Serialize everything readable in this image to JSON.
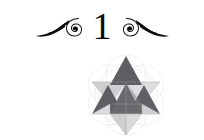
{
  "page": {
    "background_color": "#ffffff",
    "kind": "chapter-opening-page"
  },
  "heading": {
    "chapter_number": "1",
    "left_flourish_icon": "swash-flourish-left-icon",
    "right_flourish_icon": "swash-flourish-right-icon",
    "ink_color": "#0d0d0d"
  },
  "illustration": {
    "title": "star-tetrahedron-merkaba",
    "background_pattern": "flower-of-life-circles",
    "background_pattern_color": "#e8e6ea",
    "palette": {
      "dark": "#5f5f63",
      "dark_alt": "#6a6a6e",
      "mid": "#8e8e92",
      "light": "#c9c9cb",
      "lighter": "#dcdcde",
      "pale": "#efeff0",
      "outline": "#b5b5b8"
    },
    "facets": [
      {
        "name": "top-spike",
        "tone": "dark"
      },
      {
        "name": "upper-left-face",
        "tone": "light"
      },
      {
        "name": "upper-right-face",
        "tone": "lighter"
      },
      {
        "name": "left-spike",
        "tone": "dark"
      },
      {
        "name": "right-spike",
        "tone": "dark"
      },
      {
        "name": "center-front-face",
        "tone": "dark"
      },
      {
        "name": "center-left-face",
        "tone": "pale"
      },
      {
        "name": "center-right-face",
        "tone": "light"
      },
      {
        "name": "lower-left-face",
        "tone": "lighter"
      },
      {
        "name": "lower-right-face",
        "tone": "light"
      },
      {
        "name": "bottom-spike",
        "tone": "light"
      }
    ]
  }
}
